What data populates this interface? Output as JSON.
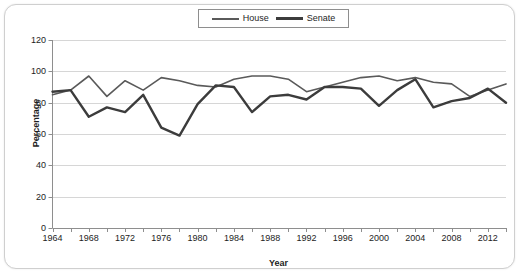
{
  "chart_data": {
    "type": "line",
    "title": "",
    "xlabel": "Year",
    "ylabel": "Percentage",
    "ylim": [
      0,
      120
    ],
    "xlim": [
      1964,
      2014
    ],
    "ytick_values": [
      0,
      20,
      40,
      60,
      80,
      100,
      120
    ],
    "xtick_values": [
      1964,
      1968,
      1972,
      1976,
      1980,
      1984,
      1988,
      1992,
      1996,
      2000,
      2004,
      2008,
      2012
    ],
    "grid": "horizontal",
    "legend_position": "top-center",
    "x": [
      1964,
      1966,
      1968,
      1970,
      1972,
      1974,
      1976,
      1978,
      1980,
      1982,
      1984,
      1986,
      1988,
      1990,
      1992,
      1994,
      1996,
      1998,
      2000,
      2002,
      2004,
      2006,
      2008,
      2010,
      2012,
      2014
    ],
    "series": [
      {
        "name": "House",
        "color": "#5a5a5a",
        "width": 1.6,
        "values": [
          85,
          88,
          97,
          84,
          94,
          88,
          96,
          94,
          91,
          90,
          95,
          98,
          98,
          96,
          88,
          90,
          94,
          98,
          98,
          96,
          98,
          94,
          94,
          85,
          90,
          95
        ]
      },
      {
        "name": "Senate",
        "color": "#3c3c3c",
        "width": 2.4,
        "values": [
          87,
          88,
          71,
          77,
          74,
          85,
          64,
          59,
          79,
          91,
          90,
          75,
          85,
          96,
          83,
          92,
          91,
          90,
          79,
          86,
          96,
          79,
          83,
          84,
          91,
          82
        ]
      }
    ],
    "house_plot": [
      85,
      88,
      97,
      84,
      94,
      88,
      96,
      94,
      91,
      90,
      95,
      97,
      97,
      95,
      87,
      90,
      93,
      96,
      97,
      94,
      96,
      93,
      92,
      84,
      88,
      92
    ],
    "senate_plot": [
      87,
      88,
      71,
      77,
      74,
      85,
      64,
      59,
      79,
      91,
      90,
      74,
      84,
      85,
      82,
      90,
      90,
      89,
      78,
      88,
      95,
      77,
      81,
      83,
      89,
      80
    ]
  },
  "legend": {
    "items": [
      {
        "label": "House",
        "key": "house"
      },
      {
        "label": "Senate",
        "key": "senate"
      }
    ]
  },
  "axes": {
    "y_title": "Percentage",
    "x_title": "Year",
    "y_ticks": [
      "120",
      "100",
      "80",
      "60",
      "40",
      "20",
      "0"
    ],
    "x_ticks": [
      "1964",
      "1968",
      "1972",
      "1976",
      "1980",
      "1984",
      "1988",
      "1992",
      "1996",
      "2000",
      "2004",
      "2008",
      "2012"
    ]
  },
  "colors": {
    "house_line": "#5a5a5a",
    "senate_line": "#3c3c3c",
    "grid": "#d6d6d6",
    "axis": "#8e8e8e",
    "text": "#1d1d1d",
    "frame": "#cfcfcf",
    "background": "#ffffff"
  }
}
